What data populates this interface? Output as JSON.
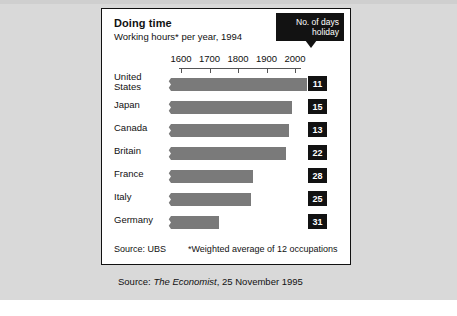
{
  "figure": {
    "title": "Doing time",
    "subtitle": "Working hours* per year, 1994",
    "callout_line1": "No. of days",
    "callout_line2": "holiday",
    "source_label": "Source: UBS",
    "footnote": "*Weighted average of 12 occupations",
    "outer_source_prefix": "Source: ",
    "outer_source_italic": "The Economist",
    "outer_source_suffix": ", 25 November 1995"
  },
  "chart_data": {
    "type": "bar",
    "orientation": "horizontal",
    "title": "Doing time",
    "subtitle": "Working hours* per year, 1994",
    "xlabel": "",
    "ylabel": "",
    "xlim": [
      1550,
      2060
    ],
    "axis_ticks": [
      1600,
      1700,
      1800,
      1900,
      2000
    ],
    "tick_labels": [
      "1600",
      "1700",
      "1800",
      "1900",
      "2000"
    ],
    "grid": false,
    "legend": null,
    "axis_break": true,
    "categories": [
      "United States",
      "Japan",
      "Canada",
      "Britain",
      "France",
      "Italy",
      "Germany"
    ],
    "values": [
      2042,
      1989,
      1979,
      1968,
      1853,
      1846,
      1733
    ],
    "series": [
      {
        "name": "Working hours per year",
        "values": [
          2042,
          1989,
          1979,
          1968,
          1853,
          1846,
          1733
        ]
      }
    ],
    "annotations": {
      "name": "No. of days holiday",
      "values": [
        11,
        15,
        13,
        22,
        28,
        25,
        31
      ]
    },
    "bar_color": "#7a7a7a",
    "badge_color": "#121212"
  },
  "rows": [
    {
      "label": "United\nStates",
      "two_line": true,
      "hours": 2042,
      "holiday": "11"
    },
    {
      "label": "Japan",
      "two_line": false,
      "hours": 1989,
      "holiday": "15"
    },
    {
      "label": "Canada",
      "two_line": false,
      "hours": 1979,
      "holiday": "13"
    },
    {
      "label": "Britain",
      "two_line": false,
      "hours": 1968,
      "holiday": "22"
    },
    {
      "label": "France",
      "two_line": false,
      "hours": 1853,
      "holiday": "28"
    },
    {
      "label": "Italy",
      "two_line": false,
      "hours": 1846,
      "holiday": "25"
    },
    {
      "label": "Germany",
      "two_line": false,
      "hours": 1733,
      "holiday": "31"
    }
  ]
}
